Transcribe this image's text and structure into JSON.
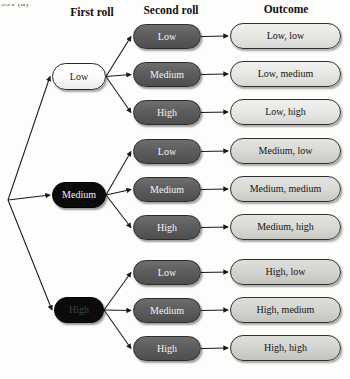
{
  "page": {
    "corner_code": "591 (a)",
    "width": 350,
    "height": 379,
    "background": "#fdfdfc"
  },
  "headers": [
    {
      "label": "First roll",
      "x": 52,
      "y": 6,
      "w": 80
    },
    {
      "label": "Second roll",
      "x": 132,
      "y": 4,
      "w": 78
    },
    {
      "label": "Outcome",
      "x": 238,
      "y": 3,
      "w": 96
    }
  ],
  "colors": {
    "first_light_fill": "#ffffff",
    "first_dark_fill": "#0b0b0b",
    "second_fill": "#5d5d5d",
    "outcome_fill": "#e6e6e3",
    "outline": "#2a2a2a",
    "edge": "#1a1a1a",
    "text_dark": "#141414",
    "text_light": "#f4f4f4"
  },
  "root": {
    "x": 8,
    "y": 200
  },
  "first_roll": [
    {
      "id": "first-low",
      "label": "Low",
      "x": 52,
      "y": 63,
      "w": 54,
      "h": 27,
      "style": "light"
    },
    {
      "id": "first-medium",
      "label": "Medium",
      "x": 52,
      "y": 182,
      "w": 54,
      "h": 26,
      "style": "dark"
    },
    {
      "id": "first-high",
      "label": "High",
      "x": 54,
      "y": 297,
      "w": 50,
      "h": 26,
      "style": "dark-dim"
    }
  ],
  "second_roll": [
    {
      "id": "second-low-1",
      "label": "Low",
      "x": 133,
      "y": 24,
      "w": 68,
      "h": 25,
      "group": "low"
    },
    {
      "id": "second-medium-1",
      "label": "Medium",
      "x": 133,
      "y": 62,
      "w": 68,
      "h": 25,
      "group": "low"
    },
    {
      "id": "second-high-1",
      "label": "High",
      "x": 133,
      "y": 100,
      "w": 68,
      "h": 25,
      "group": "low"
    },
    {
      "id": "second-low-2",
      "label": "Low",
      "x": 133,
      "y": 139,
      "w": 68,
      "h": 25,
      "group": "medium"
    },
    {
      "id": "second-medium-2",
      "label": "Medium",
      "x": 133,
      "y": 177,
      "w": 68,
      "h": 25,
      "group": "medium"
    },
    {
      "id": "second-high-2",
      "label": "High",
      "x": 133,
      "y": 215,
      "w": 68,
      "h": 25,
      "group": "medium"
    },
    {
      "id": "second-low-3",
      "label": "Low",
      "x": 133,
      "y": 260,
      "w": 68,
      "h": 25,
      "group": "high"
    },
    {
      "id": "second-medium-3",
      "label": "Medium",
      "x": 133,
      "y": 298,
      "w": 68,
      "h": 25,
      "group": "high"
    },
    {
      "id": "second-high-3",
      "label": "High",
      "x": 133,
      "y": 336,
      "w": 68,
      "h": 25,
      "group": "high"
    }
  ],
  "outcomes": [
    {
      "id": "outcome-low-low",
      "label": "Low, low",
      "x": 230,
      "y": 23,
      "w": 111,
      "h": 26,
      "shade": "light"
    },
    {
      "id": "outcome-low-medium",
      "label": "Low, medium",
      "x": 230,
      "y": 61,
      "w": 111,
      "h": 26,
      "shade": "light"
    },
    {
      "id": "outcome-low-high",
      "label": "Low, high",
      "x": 230,
      "y": 99,
      "w": 111,
      "h": 26,
      "shade": "light"
    },
    {
      "id": "outcome-medium-low",
      "label": "Medium, low",
      "x": 230,
      "y": 138,
      "w": 111,
      "h": 26,
      "shade": "mid"
    },
    {
      "id": "outcome-medium-medium",
      "label": "Medium, medium",
      "x": 230,
      "y": 176,
      "w": 111,
      "h": 26,
      "shade": "mid"
    },
    {
      "id": "outcome-medium-high",
      "label": "Medium, high",
      "x": 230,
      "y": 214,
      "w": 111,
      "h": 26,
      "shade": "mid"
    },
    {
      "id": "outcome-high-low",
      "label": "High, low",
      "x": 230,
      "y": 259,
      "w": 111,
      "h": 26,
      "shade": "low"
    },
    {
      "id": "outcome-high-medium",
      "label": "High, medium",
      "x": 230,
      "y": 297,
      "w": 111,
      "h": 26,
      "shade": "low"
    },
    {
      "id": "outcome-high-high",
      "label": "High, high",
      "x": 230,
      "y": 335,
      "w": 111,
      "h": 26,
      "shade": "low"
    }
  ],
  "edges": {
    "root_to_first": [
      {
        "from": "root",
        "to": "first-low"
      },
      {
        "from": "root",
        "to": "first-medium"
      },
      {
        "from": "root",
        "to": "first-high"
      }
    ],
    "first_to_second": [
      {
        "from": "first-low",
        "to": "second-low-1"
      },
      {
        "from": "first-low",
        "to": "second-medium-1"
      },
      {
        "from": "first-low",
        "to": "second-high-1"
      },
      {
        "from": "first-medium",
        "to": "second-low-2"
      },
      {
        "from": "first-medium",
        "to": "second-medium-2"
      },
      {
        "from": "first-medium",
        "to": "second-high-2"
      },
      {
        "from": "first-high",
        "to": "second-low-3"
      },
      {
        "from": "first-high",
        "to": "second-medium-3"
      },
      {
        "from": "first-high",
        "to": "second-high-3"
      }
    ],
    "second_to_outcome": [
      {
        "from": "second-low-1",
        "to": "outcome-low-low"
      },
      {
        "from": "second-medium-1",
        "to": "outcome-low-medium"
      },
      {
        "from": "second-high-1",
        "to": "outcome-low-high"
      },
      {
        "from": "second-low-2",
        "to": "outcome-medium-low"
      },
      {
        "from": "second-medium-2",
        "to": "outcome-medium-medium"
      },
      {
        "from": "second-high-2",
        "to": "outcome-medium-high"
      },
      {
        "from": "second-low-3",
        "to": "outcome-high-low"
      },
      {
        "from": "second-medium-3",
        "to": "outcome-high-medium"
      },
      {
        "from": "second-high-3",
        "to": "outcome-high-high"
      }
    ]
  }
}
